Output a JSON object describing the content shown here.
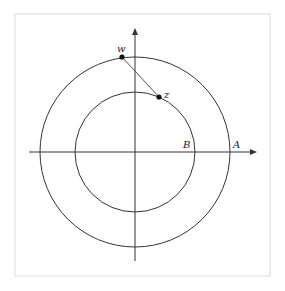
{
  "figure": {
    "frame": {
      "x": 15,
      "y": 14,
      "width": 255,
      "height": 262,
      "stroke": "#dcdcdc"
    },
    "origin": {
      "x": 135,
      "y": 152
    },
    "axes": {
      "x_axis": {
        "x1": 29,
        "x2": 257,
        "y": 152
      },
      "y_axis": {
        "x": 135,
        "y1": 261,
        "y2": 28
      },
      "color": "#333333"
    },
    "circles": [
      {
        "name": "outer-circle",
        "r": 95,
        "stroke": "#333333"
      },
      {
        "name": "inner-circle",
        "r": 60,
        "stroke": "#333333"
      }
    ],
    "segment": {
      "from": "w",
      "to": "z",
      "stroke": "#555555"
    },
    "points": {
      "w": {
        "label": "w",
        "x": 122,
        "y": 57,
        "label_x": 117,
        "label_y": 52
      },
      "z": {
        "label": "z",
        "x": 159,
        "y": 97,
        "label_x": 164,
        "label_y": 98
      }
    },
    "labels": {
      "A": {
        "text": "A",
        "x": 233,
        "y": 148
      },
      "B": {
        "text": "B",
        "x": 183,
        "y": 148
      }
    }
  }
}
